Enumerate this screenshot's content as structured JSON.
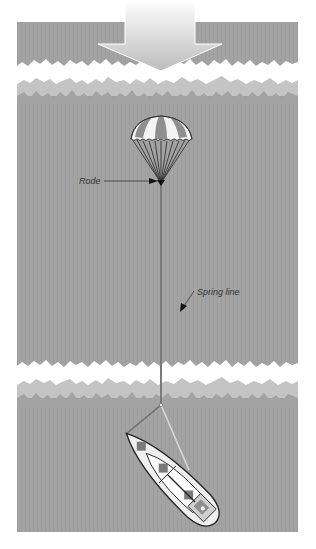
{
  "diagram": {
    "type": "illustration",
    "labels": {
      "rode": "Rode",
      "spring_line": "Spring line"
    },
    "elements": [
      {
        "name": "wind-wave-direction-arrow",
        "description": "Large gradient arrow pointing down, indicating direction of wind and seas"
      },
      {
        "name": "wave-band-top",
        "description": "Breaking wave crest band near top"
      },
      {
        "name": "parachute-sea-anchor",
        "description": "Striped parachute sea anchor with shroud lines converging at rode"
      },
      {
        "name": "rode-line",
        "description": "Vertical line from parachute down toward boat"
      },
      {
        "name": "wave-band-bottom",
        "description": "Breaking wave crest band above boat"
      },
      {
        "name": "bridle-bow-line",
        "description": "Dark line from rode junction to the bow"
      },
      {
        "name": "spring-line",
        "description": "Light line from rode junction to the boat's quarter"
      },
      {
        "name": "sailboat",
        "description": "Top-down sailboat lying at an angle to the seas"
      }
    ],
    "colors": {
      "sea": "#a3a3a3",
      "sea_light": "#c4c4c4",
      "foam": "#ffffff",
      "rode": "#7a7a7a",
      "spring_line": "#d8d8d8",
      "hull": "#efefef",
      "outline": "#222222",
      "canopy_dark": "#8f8f8f",
      "canopy_light": "#f4f4f4"
    }
  }
}
